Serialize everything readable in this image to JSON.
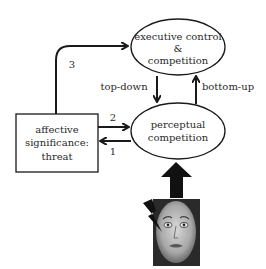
{
  "diagram": {
    "nodes": {
      "executive": {
        "line1": "executive control",
        "line2": "&",
        "line3": "competition"
      },
      "perceptual": {
        "line1": "perceptual",
        "line2": "competition"
      },
      "affective": {
        "line1": "affective",
        "line2": "significance:",
        "line3": "threat"
      }
    },
    "edges": {
      "top_down": "top-down",
      "bottom_up": "bottom-up",
      "path1": "1",
      "path2": "2",
      "path3": "3"
    },
    "stimulus": {
      "icon": "fearful-face-image",
      "marker": "lightning-bolt-icon"
    },
    "colors": {
      "stroke": "#1a1a1a",
      "text": "#2a2a2a",
      "background": "#ffffff"
    }
  }
}
